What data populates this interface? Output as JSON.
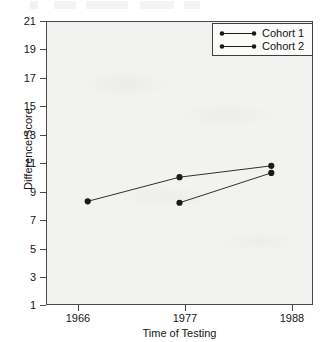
{
  "chart_data": {
    "type": "line",
    "title": "",
    "subtitle": "",
    "xlabel": "Time of Testing",
    "ylabel": "Difference Score",
    "categories": [
      "1966",
      "1977",
      "1988"
    ],
    "x": [
      1966,
      1977,
      1988
    ],
    "xlim": [
      1961,
      1993
    ],
    "ylim": [
      1,
      21
    ],
    "ytick_labels": [
      "1",
      "3",
      "5",
      "7",
      "9",
      "11",
      "13",
      "15",
      "17",
      "19",
      "21"
    ],
    "yticks": [
      1,
      3,
      5,
      7,
      9,
      11,
      13,
      15,
      17,
      19,
      21
    ],
    "xtick_labels": [
      "1966",
      "1977",
      "1988"
    ],
    "grid": false,
    "legend_position": "top-right",
    "marker": "filled-circle",
    "series": [
      {
        "name": "Cohort 1",
        "color": "#1a1a1a",
        "x": [
          1966,
          1977,
          1988
        ],
        "values": [
          8.3,
          10.0,
          10.8
        ]
      },
      {
        "name": "Cohort 2",
        "color": "#1a1a1a",
        "x": [
          1977,
          1988
        ],
        "values": [
          8.2,
          10.3
        ]
      }
    ],
    "annotations": []
  },
  "legend": {
    "entries": [
      {
        "label": "Cohort 1"
      },
      {
        "label": "Cohort 2"
      }
    ]
  },
  "axes": {
    "y_title": "Difference Score",
    "x_title": "Time of Testing",
    "y_labels": [
      "21",
      "19",
      "17",
      "15",
      "13",
      "11",
      "9",
      "7",
      "5",
      "3",
      "1"
    ],
    "x_labels": [
      "1966",
      "1977",
      "1988"
    ]
  },
  "colors": {
    "panel_background": "#f2f2f0",
    "page_background": "#ffffff",
    "axis": "#4a4a4a",
    "series": "#1a1a1a",
    "legend_background": "#fbfbfa",
    "legend_border": "#3d3d3d"
  }
}
